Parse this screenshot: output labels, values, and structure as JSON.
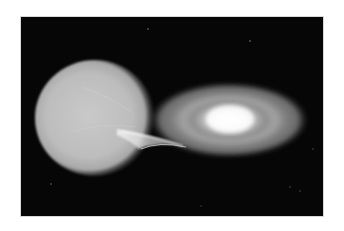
{
  "image": {
    "alt": "Binary star system: a large glowing star transferring gas through a stream into an accretion disk around a compact companion",
    "background_color": "#ffffff",
    "space_color": "#060606",
    "donor_star": {
      "name": "donor-star",
      "color": "#cfcfcf"
    },
    "accretion_disk": {
      "name": "accretion-disk",
      "core_color": "#ffffff",
      "ring_color": "#9a9a9a"
    },
    "mass_stream": {
      "name": "mass-transfer-stream",
      "color": "#ececec"
    },
    "background_stars": [
      {
        "x": 127,
        "y": 12
      },
      {
        "x": 229,
        "y": 24
      },
      {
        "x": 30,
        "y": 167
      },
      {
        "x": 269,
        "y": 170
      },
      {
        "x": 279,
        "y": 174
      },
      {
        "x": 292,
        "y": 132
      },
      {
        "x": 180,
        "y": 189
      }
    ]
  }
}
